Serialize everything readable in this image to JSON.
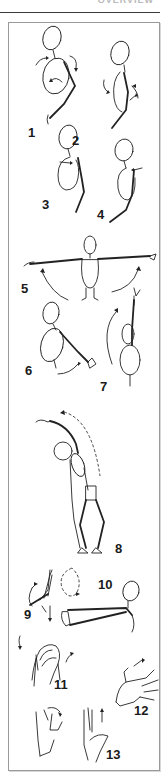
{
  "header": {
    "section_title": "OVERVIEW"
  },
  "illustration": {
    "description": "Numbered stretching exercise sketches",
    "exercises": [
      {
        "number": "1",
        "name": "shoulder-roll"
      },
      {
        "number": "2",
        "name": "shoulder-roll-side"
      },
      {
        "number": "3",
        "name": "shoulder-blade-squeeze"
      },
      {
        "number": "4",
        "name": "shoulder-shrug"
      },
      {
        "number": "5",
        "name": "arm-raise-sideways"
      },
      {
        "number": "6",
        "name": "arm-forward-swing"
      },
      {
        "number": "7",
        "name": "arm-raise-overhead"
      },
      {
        "number": "8",
        "name": "side-bend"
      },
      {
        "number": "9",
        "name": "wrist-circle"
      },
      {
        "number": "10",
        "name": "arm-extension"
      },
      {
        "number": "11",
        "name": "hand-clasp-rotation"
      },
      {
        "number": "12",
        "name": "finger-spread"
      },
      {
        "number": "13",
        "name": "wrist-flex"
      }
    ]
  }
}
